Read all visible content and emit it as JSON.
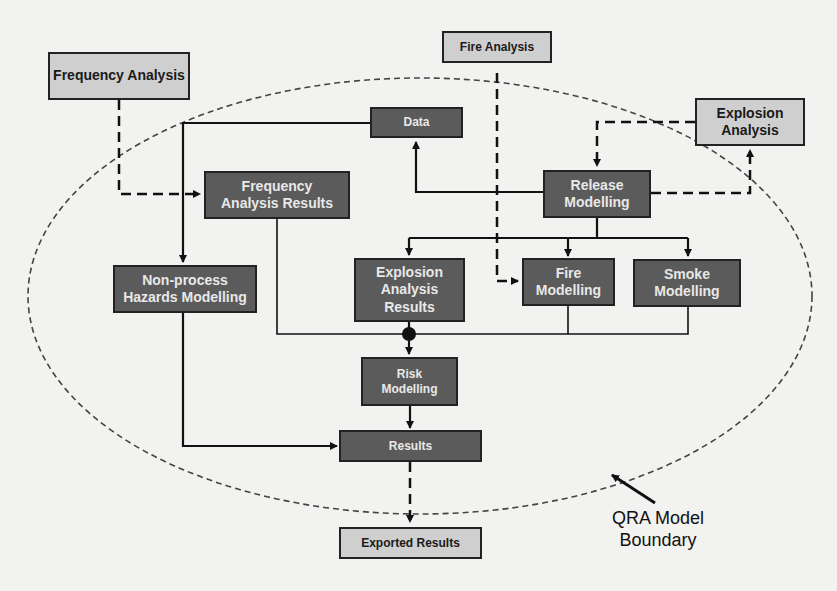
{
  "diagram": {
    "colors": {
      "background": "#f2f2f0",
      "internal_box": "#5b5b5b",
      "external_box": "#cfcfcf",
      "line": "#111111"
    },
    "external_inputs": {
      "frequency_analysis": "Frequency Analysis",
      "fire_analysis": "Fire Analysis",
      "explosion_analysis": "Explosion Analysis"
    },
    "internal_nodes": {
      "data": "Data",
      "frequency_analysis_results": "Frequency Analysis Results",
      "release_modelling": "Release Modelling",
      "non_process_hazards_modelling": "Non-process Hazards Modelling",
      "explosion_analysis_results": "Explosion Analysis Results",
      "fire_modelling": "Fire Modelling",
      "smoke_modelling": "Smoke Modelling",
      "risk_modelling": "Risk Modelling",
      "results": "Results"
    },
    "outputs": {
      "exported_results": "Exported Results"
    },
    "boundary_label": "QRA Model Boundary",
    "boundary_label_lines": [
      "QRA Model",
      "Boundary"
    ]
  }
}
